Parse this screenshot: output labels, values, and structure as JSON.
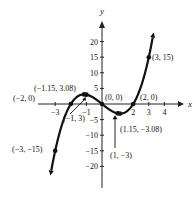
{
  "chart_data": {
    "type": "line",
    "title": "",
    "xlabel": "x",
    "ylabel": "y",
    "xlim": [
      -3.3,
      4.4
    ],
    "ylim": [
      -24,
      26
    ],
    "grid": false,
    "function": "f(x) = x^3 - 4x",
    "x_ticks": [
      -3,
      -1,
      2,
      3,
      4
    ],
    "x_tick_labels": [
      "−3",
      "−1",
      "2",
      "3",
      "4"
    ],
    "y_ticks": [
      20,
      15,
      10,
      5,
      -5,
      -10,
      -15,
      -20
    ],
    "y_tick_labels": [
      "20",
      "15",
      "10",
      "5",
      "−5",
      "−10",
      "−15",
      "−20"
    ],
    "curve_domain": [
      -3.25,
      3.25
    ],
    "points": [
      {
        "x": -3,
        "y": -15,
        "label": "(−3, −15)"
      },
      {
        "x": -2,
        "y": 0,
        "label": "(−2, 0)"
      },
      {
        "x": -1.15,
        "y": 3.08,
        "label": "(−1.15, 3.08)"
      },
      {
        "x": -1,
        "y": 3,
        "label": "(−1, 3)"
      },
      {
        "x": 0,
        "y": 0,
        "label": "(0, 0)"
      },
      {
        "x": 1,
        "y": -3,
        "label": "(1, −3)"
      },
      {
        "x": 1.15,
        "y": -3.08,
        "label": "(1.15, −3.08)"
      },
      {
        "x": 2,
        "y": 0,
        "label": "(2, 0)"
      },
      {
        "x": 3,
        "y": 15,
        "label": "(3, 15)"
      }
    ]
  }
}
